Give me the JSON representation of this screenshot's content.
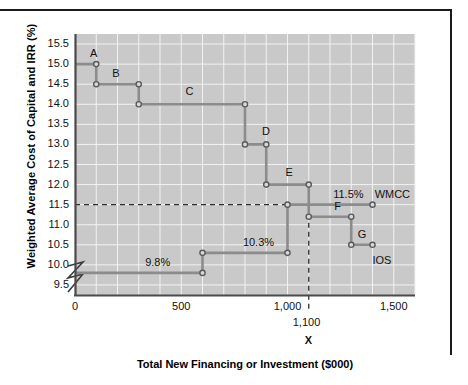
{
  "figure": {
    "y_axis_title": "Weighted Average Cost of Capital and IRR (%)",
    "x_axis_title": "Total New Financing or Investment ($000)"
  },
  "chart_data": {
    "type": "line",
    "title": "",
    "xlabel": "Total New Financing or Investment ($000)",
    "ylabel": "Weighted Average Cost of Capital and IRR (%)",
    "xlim": [
      0,
      1600
    ],
    "ylim": [
      9.25,
      15.75
    ],
    "xticks": [
      0,
      500,
      1000,
      1500
    ],
    "xtick_labels": [
      "0",
      "500",
      "1,000",
      "1,500"
    ],
    "yticks": [
      9.5,
      10.0,
      10.5,
      11.0,
      11.5,
      12.0,
      12.5,
      13.0,
      13.5,
      14.0,
      14.5,
      15.0,
      15.5
    ],
    "ytick_labels": [
      "9.5",
      "10.0",
      "10.5",
      "11.0",
      "11.5",
      "12.0",
      "12.5",
      "13.0",
      "13.5",
      "14.0",
      "14.5",
      "15.0",
      "15.5"
    ],
    "grid": true,
    "y_axis_break": true,
    "legend_position": "inline-right",
    "series": [
      {
        "name": "IOS",
        "label": "IOS",
        "type": "step",
        "color": "#8c8c8c",
        "steps": [
          {
            "project": "A",
            "x_start": 0,
            "x_end": 100,
            "irr": 15.0
          },
          {
            "project": "B",
            "x_start": 100,
            "x_end": 300,
            "irr": 14.5
          },
          {
            "project": "C",
            "x_start": 300,
            "x_end": 800,
            "irr": 14.0
          },
          {
            "project": "D",
            "x_start": 800,
            "x_end": 900,
            "irr": 13.0
          },
          {
            "project": "E",
            "x_start": 900,
            "x_end": 1100,
            "irr": 12.0
          },
          {
            "project": "F",
            "x_start": 1100,
            "x_end": 1300,
            "irr": 11.2
          },
          {
            "project": "G",
            "x_start": 1300,
            "x_end": 1400,
            "irr": 10.5
          }
        ]
      },
      {
        "name": "WMCC",
        "label": "WMCC",
        "type": "step",
        "color": "#8c8c8c",
        "steps": [
          {
            "x_start": 0,
            "x_end": 600,
            "wacc": 9.8,
            "data_label": "9.8%"
          },
          {
            "x_start": 600,
            "x_end": 1000,
            "wacc": 10.3,
            "data_label": "10.3%"
          },
          {
            "x_start": 1000,
            "x_end": 1400,
            "wacc": 11.5,
            "data_label": "11.5%"
          }
        ]
      }
    ],
    "annotations": [
      {
        "name": "project-a-label",
        "text": "A",
        "x": 70,
        "y": 15.25
      },
      {
        "name": "project-b-label",
        "text": "B",
        "x": 175,
        "y": 14.75
      },
      {
        "name": "project-c-label",
        "text": "C",
        "x": 520,
        "y": 14.3
      },
      {
        "name": "project-d-label",
        "text": "D",
        "x": 880,
        "y": 13.3
      },
      {
        "name": "project-e-label",
        "text": "E",
        "x": 990,
        "y": 12.3
      },
      {
        "name": "project-f-label",
        "text": "F",
        "x": 1220,
        "y": 11.45
      },
      {
        "name": "project-g-label",
        "text": "G",
        "x": 1330,
        "y": 10.75
      },
      {
        "name": "wacc-9-8-label",
        "text": "9.8%",
        "x": 330,
        "y": 10.05
      },
      {
        "name": "wacc-10-3-label",
        "text": "10.3%",
        "x": 790,
        "y": 10.55
      },
      {
        "name": "wacc-11-5-label",
        "text": "11.5%",
        "x": 1215,
        "y": 11.75
      },
      {
        "name": "wmcc-curve-label",
        "text": "WMCC",
        "x": 1410,
        "y": 11.75
      },
      {
        "name": "ios-curve-label",
        "text": "IOS",
        "x": 1400,
        "y": 10.1
      }
    ],
    "optimal_capital_budget": {
      "x": 1100,
      "label": "1,100",
      "marker": "X",
      "guide_line_vertical": true,
      "guide_line_horizontal": {
        "y": 11.5
      }
    }
  }
}
